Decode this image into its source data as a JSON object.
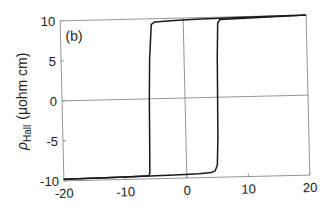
{
  "chart_data": {
    "type": "line",
    "title": "",
    "panel_label": "(b)",
    "xlabel": "",
    "ylabel": "ρHall (μohm cm)",
    "ylabel_parts": {
      "symbol": "ρ",
      "subscript": "Hall",
      "unit": "(μohm cm)"
    },
    "xlim": [
      -20,
      20
    ],
    "ylim": [
      -10,
      10
    ],
    "xticks": [
      -20,
      -10,
      0,
      10,
      20
    ],
    "yticks": [
      -10,
      -5,
      0,
      5,
      10
    ],
    "xtick_labels": [
      "-20",
      "-10",
      "0",
      "10",
      "20"
    ],
    "ytick_labels": [
      "-10",
      "-5",
      "0",
      "5",
      "10"
    ],
    "grid": false,
    "reference_lines": {
      "horizontal_at_y": 0,
      "vertical_at_x": 0
    },
    "legend": null,
    "series": [
      {
        "name": "sweep up (lower branch)",
        "x": [
          -20,
          -10,
          -2,
          2,
          4,
          4.6,
          5.0,
          5.2,
          5.3,
          5.4,
          5.6,
          6,
          10,
          20
        ],
        "y": [
          -9.8,
          -9.7,
          -9.6,
          -9.5,
          -9.4,
          -9.2,
          -8.5,
          -5,
          0,
          5,
          9.3,
          9.7,
          9.8,
          10.0
        ]
      },
      {
        "name": "sweep down (upper branch)",
        "x": [
          20,
          10,
          2,
          -2,
          -4.6,
          -5.2,
          -5.6,
          -5.8,
          -5.9,
          -6.0,
          -6.2,
          -10,
          -20
        ],
        "y": [
          10.0,
          9.9,
          9.8,
          9.7,
          9.6,
          9.3,
          5,
          0,
          -5,
          -9.3,
          -9.6,
          -9.7,
          -9.8
        ]
      }
    ]
  }
}
